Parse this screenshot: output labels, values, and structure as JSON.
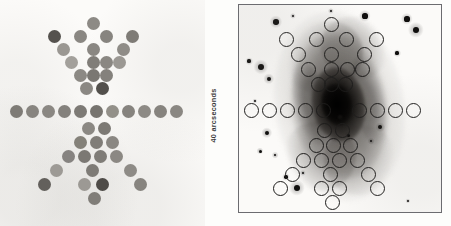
{
  "figure": {
    "scale_label": "40 arcseconds",
    "accent_color": "#1d1c1b",
    "panel_border_color": "#6c6c70",
    "background_color": "#fdfdfb"
  },
  "left_panel": {
    "name": "fiber-aperture-map",
    "description": "Filled grey circles showing the fiber bundle / aperture footprint",
    "circle_diameter_px": 13,
    "fibers": [
      {
        "x": 87,
        "y": 17,
        "shade": "#8d8a85"
      },
      {
        "x": 48,
        "y": 30,
        "shade": "#55524e"
      },
      {
        "x": 74,
        "y": 30,
        "shade": "#8a8782"
      },
      {
        "x": 100,
        "y": 30,
        "shade": "#87847f"
      },
      {
        "x": 126,
        "y": 30,
        "shade": "#7e7b76"
      },
      {
        "x": 57,
        "y": 43,
        "shade": "#9a9792"
      },
      {
        "x": 87,
        "y": 43,
        "shade": "#8a8782"
      },
      {
        "x": 117,
        "y": 43,
        "shade": "#8f8c87"
      },
      {
        "x": 65,
        "y": 56,
        "shade": "#a3a09b"
      },
      {
        "x": 87,
        "y": 56,
        "shade": "#807d78"
      },
      {
        "x": 100,
        "y": 56,
        "shade": "#8a8782"
      },
      {
        "x": 113,
        "y": 56,
        "shade": "#9b9893"
      },
      {
        "x": 74,
        "y": 69,
        "shade": "#8c8984"
      },
      {
        "x": 87,
        "y": 69,
        "shade": "#7a7772"
      },
      {
        "x": 100,
        "y": 69,
        "shade": "#84817c"
      },
      {
        "x": 80,
        "y": 82,
        "shade": "#8b8883"
      },
      {
        "x": 96,
        "y": 82,
        "shade": "#53504c"
      },
      {
        "x": 10,
        "y": 105,
        "shade": "#7e7b76"
      },
      {
        "x": 26,
        "y": 105,
        "shade": "#87847f"
      },
      {
        "x": 42,
        "y": 105,
        "shade": "#8a8782"
      },
      {
        "x": 58,
        "y": 105,
        "shade": "#84817c"
      },
      {
        "x": 74,
        "y": 105,
        "shade": "#7d7a75"
      },
      {
        "x": 90,
        "y": 105,
        "shade": "#77746f"
      },
      {
        "x": 106,
        "y": 105,
        "shade": "#939089"
      },
      {
        "x": 122,
        "y": 105,
        "shade": "#86837e"
      },
      {
        "x": 138,
        "y": 105,
        "shade": "#8d8a85"
      },
      {
        "x": 154,
        "y": 105,
        "shade": "#86837e"
      },
      {
        "x": 170,
        "y": 105,
        "shade": "#8a8782"
      },
      {
        "x": 82,
        "y": 122,
        "shade": "#8b8883"
      },
      {
        "x": 98,
        "y": 122,
        "shade": "#7c7974"
      },
      {
        "x": 74,
        "y": 136,
        "shade": "#848179"
      },
      {
        "x": 90,
        "y": 136,
        "shade": "#807d78"
      },
      {
        "x": 106,
        "y": 136,
        "shade": "#8a8782"
      },
      {
        "x": 62,
        "y": 150,
        "shade": "#868380"
      },
      {
        "x": 78,
        "y": 150,
        "shade": "#7b7873"
      },
      {
        "x": 94,
        "y": 150,
        "shade": "#7f7c77"
      },
      {
        "x": 110,
        "y": 150,
        "shade": "#8b8883"
      },
      {
        "x": 50,
        "y": 164,
        "shade": "#9d9a95"
      },
      {
        "x": 86,
        "y": 164,
        "shade": "#7e7b76"
      },
      {
        "x": 124,
        "y": 164,
        "shade": "#8e8b86"
      },
      {
        "x": 38,
        "y": 178,
        "shade": "#63605c"
      },
      {
        "x": 78,
        "y": 178,
        "shade": "#9c9994"
      },
      {
        "x": 96,
        "y": 178,
        "shade": "#4e4b47"
      },
      {
        "x": 134,
        "y": 178,
        "shade": "#87847f"
      },
      {
        "x": 88,
        "y": 192,
        "shade": "#807d78"
      }
    ]
  },
  "right_panel": {
    "name": "galaxy-image-with-apertures",
    "description": "Negative-grayscale optical image of a barred spiral galaxy with the aperture pattern overlaid as open circles",
    "aperture_diameter_px": 15,
    "apertures": [
      {
        "x": 85,
        "y": 12
      },
      {
        "x": 40,
        "y": 27
      },
      {
        "x": 70,
        "y": 27
      },
      {
        "x": 100,
        "y": 27
      },
      {
        "x": 130,
        "y": 27
      },
      {
        "x": 52,
        "y": 42
      },
      {
        "x": 85,
        "y": 42
      },
      {
        "x": 118,
        "y": 42
      },
      {
        "x": 62,
        "y": 57
      },
      {
        "x": 85,
        "y": 57
      },
      {
        "x": 101,
        "y": 57
      },
      {
        "x": 116,
        "y": 57
      },
      {
        "x": 72,
        "y": 72
      },
      {
        "x": 85,
        "y": 72
      },
      {
        "x": 99,
        "y": 72
      },
      {
        "x": 5,
        "y": 98
      },
      {
        "x": 23,
        "y": 98
      },
      {
        "x": 41,
        "y": 98
      },
      {
        "x": 59,
        "y": 98
      },
      {
        "x": 77,
        "y": 98
      },
      {
        "x": 113,
        "y": 98
      },
      {
        "x": 131,
        "y": 98
      },
      {
        "x": 149,
        "y": 98
      },
      {
        "x": 167,
        "y": 98
      },
      {
        "x": 78,
        "y": 118
      },
      {
        "x": 96,
        "y": 118
      },
      {
        "x": 70,
        "y": 133
      },
      {
        "x": 87,
        "y": 133
      },
      {
        "x": 104,
        "y": 133
      },
      {
        "x": 57,
        "y": 148
      },
      {
        "x": 75,
        "y": 148
      },
      {
        "x": 93,
        "y": 148
      },
      {
        "x": 111,
        "y": 148
      },
      {
        "x": 46,
        "y": 162
      },
      {
        "x": 84,
        "y": 162
      },
      {
        "x": 122,
        "y": 162
      },
      {
        "x": 34,
        "y": 176
      },
      {
        "x": 75,
        "y": 176
      },
      {
        "x": 93,
        "y": 176
      },
      {
        "x": 131,
        "y": 176
      },
      {
        "x": 86,
        "y": 190
      }
    ],
    "stars": [
      {
        "x": 22,
        "y": 62,
        "r": 3.2
      },
      {
        "x": 10,
        "y": 56,
        "r": 1.6
      },
      {
        "x": 37,
        "y": 17,
        "r": 2.8
      },
      {
        "x": 54,
        "y": 11,
        "r": 1.3
      },
      {
        "x": 126,
        "y": 11,
        "r": 2.6
      },
      {
        "x": 168,
        "y": 14,
        "r": 2.6
      },
      {
        "x": 177,
        "y": 25,
        "r": 3.4
      },
      {
        "x": 158,
        "y": 48,
        "r": 1.6
      },
      {
        "x": 30,
        "y": 74,
        "r": 2.4
      },
      {
        "x": 16,
        "y": 96,
        "r": 1.1
      },
      {
        "x": 28,
        "y": 128,
        "r": 2.4
      },
      {
        "x": 21,
        "y": 146,
        "r": 1.5
      },
      {
        "x": 36,
        "y": 150,
        "r": 1.4
      },
      {
        "x": 141,
        "y": 122,
        "r": 2.0
      },
      {
        "x": 132,
        "y": 136,
        "r": 1.4
      },
      {
        "x": 101,
        "y": 112,
        "r": 1.6
      },
      {
        "x": 109,
        "y": 130,
        "r": 1.5
      },
      {
        "x": 64,
        "y": 168,
        "r": 1.3
      },
      {
        "x": 47,
        "y": 172,
        "r": 1.7
      },
      {
        "x": 58,
        "y": 183,
        "r": 3.4
      },
      {
        "x": 169,
        "y": 196,
        "r": 1.1
      },
      {
        "x": 92,
        "y": 6,
        "r": 1.3
      }
    ]
  }
}
